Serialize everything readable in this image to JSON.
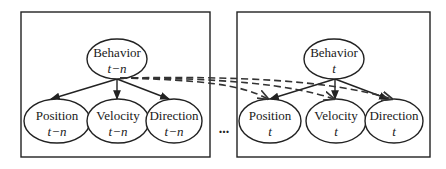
{
  "colors": {
    "stroke": "#222222",
    "dashed": "#333333",
    "background": "#ffffff"
  },
  "separator": "...",
  "slices": [
    {
      "name": "slice-t-minus-n",
      "parent": {
        "label": "Behavior",
        "time": "t−n"
      },
      "children": [
        {
          "label": "Position",
          "time": "t−n"
        },
        {
          "label": "Velocity",
          "time": "t−n"
        },
        {
          "label": "Direction",
          "time": "t−n"
        }
      ]
    },
    {
      "name": "slice-t",
      "parent": {
        "label": "Behavior",
        "time": "t"
      },
      "children": [
        {
          "label": "Position",
          "time": "t"
        },
        {
          "label": "Velocity",
          "time": "t"
        },
        {
          "label": "Direction",
          "time": "t"
        }
      ]
    }
  ],
  "temporal_edges": [
    {
      "from": "Behavior t−n",
      "to": "Position t"
    },
    {
      "from": "Behavior t−n",
      "to": "Velocity t"
    },
    {
      "from": "Behavior t−n",
      "to": "Direction t"
    }
  ]
}
